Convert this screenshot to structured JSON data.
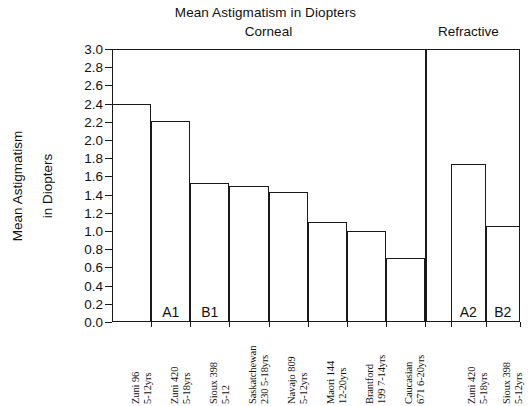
{
  "chart_data": {
    "type": "bar",
    "title": "Mean Astigmatism in Diopters",
    "xlabel": "",
    "ylabel": "Mean Astigmatism in Diopters",
    "ylabel_lines": [
      "Mean Astigmatism",
      "in Diopters"
    ],
    "ylim": [
      0.0,
      3.0
    ],
    "ytick_step": 0.2,
    "grid": false,
    "legend": "none",
    "sections": [
      {
        "name": "Corneal",
        "label": "Corneal"
      },
      {
        "name": "Refractive",
        "label": "Refractive"
      }
    ],
    "ytick_labels": [
      "3.0",
      "2.8",
      "2.6",
      "2.4",
      "2.2",
      "2.0",
      "1.8",
      "1.6",
      "1.4",
      "1.2",
      "1.0",
      "0.8",
      "0.6",
      "0.4",
      "0.2",
      "0.0"
    ],
    "ytick_values": [
      3.0,
      2.8,
      2.6,
      2.4,
      2.2,
      2.0,
      1.8,
      1.6,
      1.4,
      1.2,
      1.0,
      0.8,
      0.6,
      0.4,
      0.2,
      0.0
    ],
    "categories": [
      "Zuni 96 5-12yrs",
      "Zuni 420 5-18yrs",
      "Sioux 398 5-12",
      "Saskatchewan 230 5-18yrs",
      "Navajo 809 5-12yrs",
      "Maori 144 12-20yrs",
      "Brantford 199 7-14yrs",
      "Caucasian 671 6-20yrs",
      "Zuni 420 5-18yrs",
      "Sioux 398 5-12yrs"
    ],
    "values": [
      2.4,
      2.21,
      1.53,
      1.49,
      1.43,
      1.1,
      1.0,
      0.7,
      1.74,
      1.05
    ],
    "bars": [
      {
        "label_line1": "Zuni  96",
        "label_line2": "5-12yrs",
        "value": 2.4,
        "section": "Corneal",
        "annotation": ""
      },
      {
        "label_line1": "Zuni  420",
        "label_line2": "5-18yrs",
        "value": 2.21,
        "section": "Corneal",
        "annotation": "A1"
      },
      {
        "label_line1": "Sioux  398",
        "label_line2": "5-12",
        "value": 1.53,
        "section": "Corneal",
        "annotation": "B1"
      },
      {
        "label_line1": "Saskatchewan",
        "label_line2": "230 5-18yrs",
        "value": 1.49,
        "section": "Corneal",
        "annotation": ""
      },
      {
        "label_line1": "Navajo  809",
        "label_line2": "5-12yrs",
        "value": 1.43,
        "section": "Corneal",
        "annotation": ""
      },
      {
        "label_line1": "Maori 144",
        "label_line2": "12-20yrs",
        "value": 1.1,
        "section": "Corneal",
        "annotation": ""
      },
      {
        "label_line1": "Brantford",
        "label_line2": "199  7-14yrs",
        "value": 1.0,
        "section": "Corneal",
        "annotation": ""
      },
      {
        "label_line1": "Caucasian",
        "label_line2": "671 6-20yrs",
        "value": 0.7,
        "section": "Corneal",
        "annotation": ""
      },
      {
        "label_line1": "Zuni  420",
        "label_line2": "5-18yrs",
        "value": 1.74,
        "section": "Refractive",
        "annotation": "A2"
      },
      {
        "label_line1": "Sioux  398",
        "label_line2": "5-12yrs",
        "value": 1.05,
        "section": "Refractive",
        "annotation": "B2"
      }
    ],
    "colors": {
      "bar_fill": "#ffffff",
      "bar_stroke": "#1a1a1a",
      "axis": "#1a1a1a",
      "text": "#111111",
      "background": "#ffffff"
    }
  }
}
